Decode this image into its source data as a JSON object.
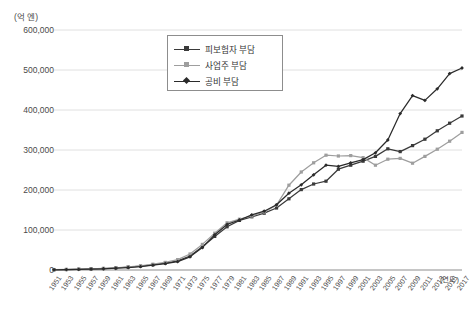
{
  "chart_data": {
    "type": "line",
    "title": "",
    "unit_label": "(억 엔)",
    "xlabel": "(연도)",
    "ylabel": "",
    "ylim": [
      0,
      600000
    ],
    "ytick_values": [
      0,
      100000,
      200000,
      300000,
      400000,
      500000,
      600000
    ],
    "ytick_labels": [
      "0",
      "100,000",
      "200,000",
      "300,000",
      "400,000",
      "500,000",
      "600,000"
    ],
    "grid": "horizontal",
    "legend_position": "upper-center-left",
    "categories": [
      "1951",
      "1953",
      "1955",
      "1957",
      "1959",
      "1961",
      "1963",
      "1965",
      "1967",
      "1969",
      "1971",
      "1973",
      "1975",
      "1977",
      "1979",
      "1981",
      "1983",
      "1985",
      "1987",
      "1989",
      "1991",
      "1993",
      "1995",
      "1997",
      "1999",
      "2001",
      "2003",
      "2005",
      "2007",
      "2009",
      "2011",
      "2013",
      "2015",
      "2017"
    ],
    "series": [
      {
        "name": "피보험자 부담",
        "color": "#3a3a3a",
        "marker": "square",
        "values": [
          800,
          1200,
          1800,
          2600,
          3600,
          5000,
          7000,
          9500,
          13000,
          17000,
          23000,
          35000,
          58000,
          84000,
          108000,
          124000,
          133000,
          142000,
          155000,
          178000,
          201000,
          215000,
          222000,
          252000,
          262000,
          272000,
          284000,
          303000,
          296000,
          311000,
          327000,
          348000,
          367000,
          385000
        ]
      },
      {
        "name": "사업주 부담",
        "color": "#9e9e9e",
        "marker": "square",
        "values": [
          900,
          1400,
          2000,
          2900,
          4100,
          5600,
          7800,
          10500,
          14500,
          19000,
          26000,
          40000,
          64000,
          92000,
          118000,
          127000,
          135000,
          145000,
          162000,
          212000,
          245000,
          268000,
          287000,
          285000,
          286000,
          281000,
          262000,
          277000,
          279000,
          267000,
          284000,
          302000,
          322000,
          344000
        ]
      },
      {
        "name": "공비 부담",
        "color": "#2b2b2b",
        "marker": "diamond",
        "values": [
          600,
          1000,
          1500,
          2200,
          3100,
          4400,
          6200,
          8600,
          12000,
          16000,
          21000,
          33000,
          56000,
          88000,
          114000,
          125000,
          138000,
          147000,
          163000,
          192000,
          213000,
          238000,
          262000,
          259000,
          268000,
          276000,
          293000,
          325000,
          391000,
          436000,
          424000,
          453000,
          491000,
          505000
        ]
      }
    ]
  }
}
